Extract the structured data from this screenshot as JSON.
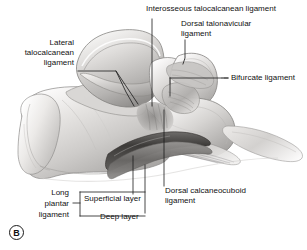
{
  "figure": {
    "panel_letter": "B",
    "background_color": "#ffffff",
    "leader_line_color": "#1a1a1a",
    "bone_light": "#f2f1f0",
    "bone_mid": "#cfcdcb",
    "bone_dark": "#8d8b89",
    "ligament_dark": "#4a4846"
  },
  "labels": {
    "interosseous": {
      "text": "Interosseous talocalcanean ligament",
      "align": "left"
    },
    "dorsal_talonavicular_line1": {
      "text": "Dorsal talonavicular"
    },
    "dorsal_talonavicular_line2": {
      "text": "ligament"
    },
    "bifurcate": {
      "text": "Bifurcate ligament"
    },
    "lateral_talocalcanean_line1": {
      "text": "Lateral"
    },
    "lateral_talocalcanean_line2": {
      "text": "talocalcanean"
    },
    "lateral_talocalcanean_line3": {
      "text": "ligament"
    },
    "dorsal_calcaneocuboid_line1": {
      "text": "Dorsal calcaneocuboid"
    },
    "dorsal_calcaneocuboid_line2": {
      "text": "ligament"
    },
    "long_plantar_line1": {
      "text": "Long"
    },
    "long_plantar_line2": {
      "text": "plantar"
    },
    "long_plantar_line3": {
      "text": "ligament"
    },
    "superficial_layer": {
      "text": "Superficial layer"
    },
    "deep_layer": {
      "text": "Deep layer"
    }
  }
}
